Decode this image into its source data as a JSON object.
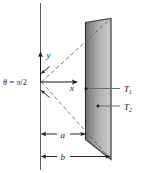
{
  "figure": {
    "type": "physics-geometry-diagram",
    "background_color": "#ffffff",
    "line_color": "#1a1a1a",
    "surface": {
      "name": "shaded-surface",
      "fill_dark": "#7d7d7d",
      "fill_light": "#c9c9c9",
      "edge_color": "#2b2b2b"
    },
    "axes": {
      "y_label": "y",
      "x_label": "x",
      "vertical_axis_name": "vertical-reference-line"
    },
    "angle": {
      "label_theta": "θ",
      "label_equals": "=",
      "label_value": "π/2",
      "full_label": "θ = π/2"
    },
    "temperatures": [
      {
        "label": "T",
        "subscript": "1"
      },
      {
        "label": "T",
        "subscript": "2"
      }
    ],
    "dimensions": [
      {
        "label": "a"
      },
      {
        "label": "b"
      }
    ]
  }
}
